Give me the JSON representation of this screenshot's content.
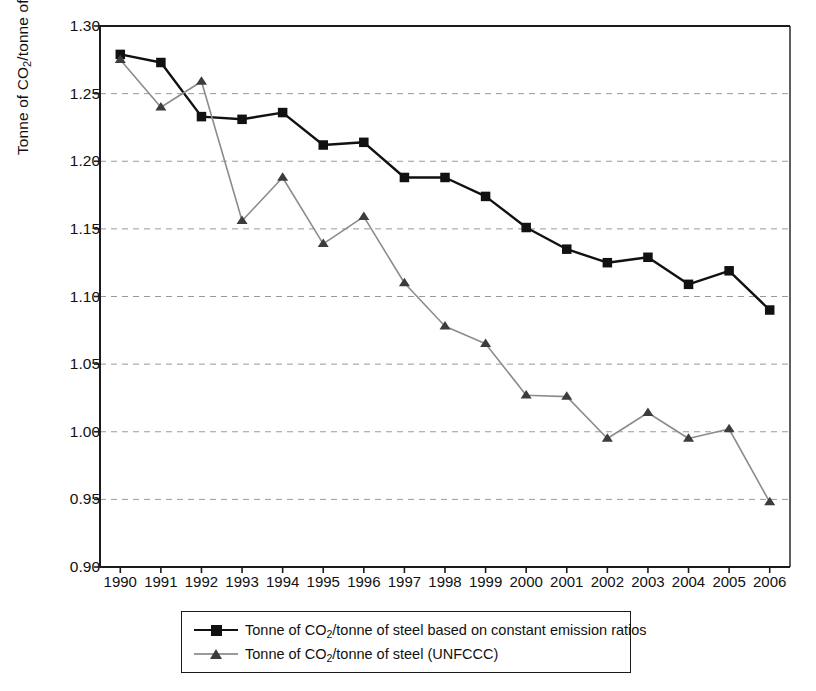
{
  "chart_data": {
    "type": "line",
    "title": "",
    "xlabel": "",
    "ylabel": "Tonne of CO2/tonne of steel",
    "ylabel_parts": {
      "pre": "Tonne of CO",
      "sub": "2",
      "post": "/tonne of steel"
    },
    "categories": [
      "1990",
      "1991",
      "1992",
      "1993",
      "1994",
      "1995",
      "1996",
      "1997",
      "1998",
      "1999",
      "2000",
      "2001",
      "2002",
      "2003",
      "2004",
      "2005",
      "2006"
    ],
    "x": [
      1990,
      1991,
      1992,
      1993,
      1994,
      1995,
      1996,
      1997,
      1998,
      1999,
      2000,
      2001,
      2002,
      2003,
      2004,
      2005,
      2006
    ],
    "ylim": [
      0.9,
      1.3
    ],
    "yticks": [
      "0.90",
      "0.95",
      "1.00",
      "1.05",
      "1.10",
      "1.15",
      "1.20",
      "1.25",
      "1.30"
    ],
    "ytick_values": [
      0.9,
      0.95,
      1.0,
      1.05,
      1.1,
      1.15,
      1.2,
      1.25,
      1.3
    ],
    "grid": "horizontal-dashed",
    "legend_position": "bottom",
    "series": [
      {
        "name": "Tonne of CO2/tonne of steel based on constant emission ratios",
        "label_parts": {
          "pre": "Tonne of CO",
          "sub": "2",
          "post": "/tonne of steel based on constant emission ratios"
        },
        "marker": "square",
        "color": "#111111",
        "values": [
          1.279,
          1.273,
          1.233,
          1.231,
          1.236,
          1.212,
          1.214,
          1.188,
          1.188,
          1.174,
          1.151,
          1.135,
          1.125,
          1.129,
          1.109,
          1.119,
          1.09
        ]
      },
      {
        "name": "Tonne of CO2/tonne of steel (UNFCCC)",
        "label_parts": {
          "pre": "Tonne of CO",
          "sub": "2",
          "post": "/tonne of steel (UNFCCC)"
        },
        "marker": "triangle",
        "color": "#8c8c8c",
        "marker_color": "#3c3c3c",
        "values": [
          1.275,
          1.24,
          1.259,
          1.156,
          1.188,
          1.139,
          1.159,
          1.11,
          1.078,
          1.065,
          1.027,
          1.026,
          0.995,
          1.014,
          0.995,
          1.002,
          0.948
        ]
      }
    ]
  },
  "axes": {
    "plot_left": 100,
    "plot_right": 790,
    "plot_top": 26,
    "plot_bottom": 567
  },
  "colors": {
    "series_black": "#111111",
    "series_gray": "#8c8c8c",
    "grid": "#9a9a9a",
    "axis": "#1b1b1b",
    "background": "#ffffff"
  }
}
